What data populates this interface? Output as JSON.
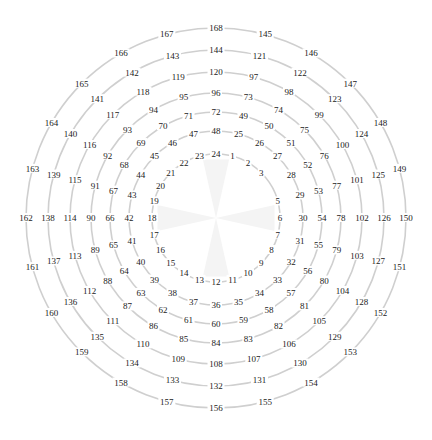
{
  "diagram": {
    "type": "concentric-number-rings",
    "center": [
      216,
      218
    ],
    "positions_per_ring": 24,
    "angle_step_deg": 15,
    "direction": "clockwise-from-top",
    "colors": {
      "ring_stroke": "#cfcfcf",
      "label_text": "#222222",
      "background": "#ffffff",
      "center_spokes": "#f4f4f4"
    },
    "rings": [
      {
        "index": 1,
        "radius": 64,
        "numbers": [
          1,
          2,
          3,
          null,
          5,
          6,
          7,
          8,
          9,
          10,
          11,
          12,
          13,
          14,
          15,
          16,
          17,
          18,
          19,
          20,
          21,
          22,
          23,
          24
        ]
      },
      {
        "index": 2,
        "radius": 87,
        "numbers": [
          25,
          26,
          27,
          28,
          29,
          30,
          31,
          32,
          33,
          34,
          35,
          36,
          37,
          38,
          39,
          40,
          41,
          42,
          43,
          44,
          45,
          46,
          47,
          48
        ]
      },
      {
        "index": 3,
        "radius": 106,
        "numbers": [
          49,
          50,
          51,
          52,
          53,
          54,
          55,
          56,
          57,
          58,
          59,
          60,
          61,
          62,
          63,
          64,
          65,
          66,
          67,
          68,
          69,
          70,
          71,
          72
        ]
      },
      {
        "index": 4,
        "radius": 125,
        "numbers": [
          73,
          74,
          75,
          76,
          77,
          78,
          79,
          80,
          81,
          82,
          83,
          84,
          85,
          86,
          87,
          88,
          89,
          90,
          91,
          92,
          93,
          94,
          95,
          96
        ]
      },
      {
        "index": 5,
        "radius": 146,
        "numbers": [
          97,
          98,
          99,
          100,
          101,
          102,
          103,
          104,
          105,
          106,
          107,
          108,
          109,
          110,
          111,
          112,
          113,
          114,
          115,
          116,
          117,
          118,
          119,
          120
        ]
      },
      {
        "index": 6,
        "radius": 168,
        "numbers": [
          121,
          122,
          123,
          124,
          125,
          126,
          127,
          128,
          129,
          130,
          131,
          132,
          133,
          134,
          135,
          136,
          137,
          138,
          139,
          140,
          141,
          142,
          143,
          144
        ]
      },
      {
        "index": 7,
        "radius": 190,
        "numbers": [
          145,
          146,
          147,
          148,
          149,
          150,
          151,
          152,
          153,
          154,
          155,
          156,
          157,
          158,
          159,
          160,
          161,
          162,
          163,
          164,
          165,
          166,
          167,
          168
        ]
      }
    ],
    "missing_numbers": [
      4
    ]
  }
}
